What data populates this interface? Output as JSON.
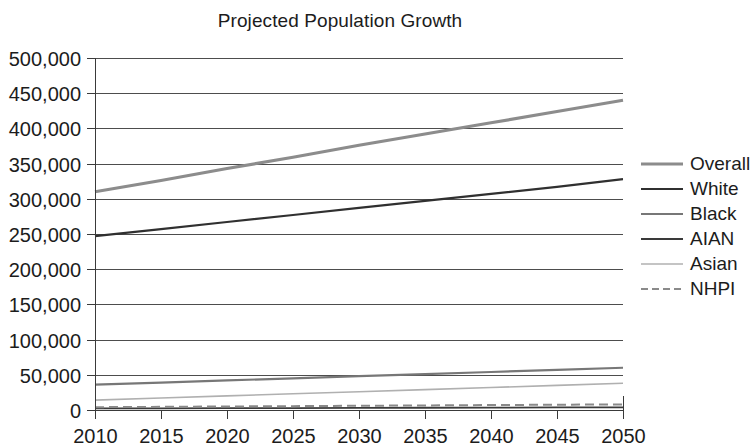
{
  "chart_data": {
    "type": "line",
    "title": "Projected Population Growth",
    "xlabel": "",
    "ylabel": "",
    "x": [
      2010,
      2015,
      2020,
      2025,
      2030,
      2035,
      2040,
      2045,
      2050
    ],
    "xtick_labels": [
      "2010",
      "2015",
      "2020",
      "2025",
      "2030",
      "2035",
      "2040",
      "2045",
      "2050"
    ],
    "ytick_labels": [
      "0",
      "50,000",
      "100,000",
      "150,000",
      "200,000",
      "250,000",
      "300,000",
      "350,000",
      "400,000",
      "450,000",
      "500,000"
    ],
    "ytick_values": [
      0,
      50000,
      100000,
      150000,
      200000,
      250000,
      300000,
      350000,
      400000,
      450000,
      500000
    ],
    "ylim": [
      0,
      500000
    ],
    "xlim": [
      2010,
      2050
    ],
    "grid": "horizontal",
    "legend_position": "right",
    "series": [
      {
        "name": "Overall",
        "color": "#8c8c8c",
        "width": 3.2,
        "dash": "none",
        "values": [
          310000,
          326000,
          343000,
          359000,
          376000,
          392000,
          408000,
          424000,
          440000
        ]
      },
      {
        "name": "White",
        "color": "#303030",
        "width": 2.2,
        "dash": "none",
        "values": [
          247000,
          257000,
          267000,
          277000,
          287000,
          297000,
          307000,
          317000,
          328000
        ]
      },
      {
        "name": "Black",
        "color": "#777777",
        "width": 2.2,
        "dash": "none",
        "values": [
          36000,
          39000,
          42000,
          45000,
          48000,
          51000,
          54000,
          57000,
          60000
        ]
      },
      {
        "name": "AIAN",
        "color": "#3a3a3a",
        "width": 1.8,
        "dash": "none",
        "values": [
          2200,
          2400,
          2600,
          2800,
          3000,
          3200,
          3400,
          3600,
          3800
        ]
      },
      {
        "name": "Asian",
        "color": "#b0b0b0",
        "width": 1.6,
        "dash": "none",
        "values": [
          14000,
          17000,
          20000,
          23000,
          26000,
          29000,
          32000,
          35000,
          38000
        ]
      },
      {
        "name": "NHPI",
        "color": "#8a8a8a",
        "width": 2.0,
        "dash": "dashed",
        "values": [
          4000,
          4500,
          5000,
          5500,
          6000,
          6500,
          7000,
          7500,
          8000
        ]
      }
    ]
  }
}
